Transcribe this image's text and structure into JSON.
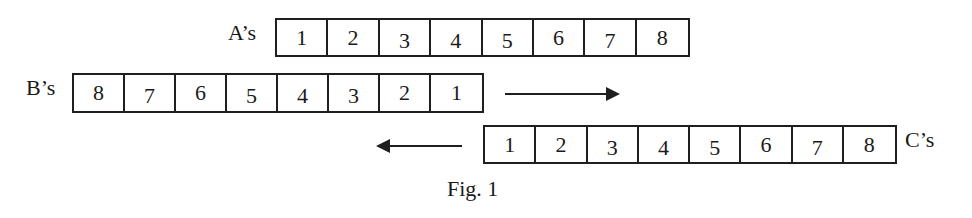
{
  "figure": {
    "caption": "Fig. 1",
    "rows": [
      {
        "id": "a",
        "label": "A’s",
        "cells": [
          "1",
          "2",
          "3",
          "4",
          "5",
          "6",
          "7",
          "8"
        ]
      },
      {
        "id": "b",
        "label": "B’s",
        "cells": [
          "8",
          "7",
          "6",
          "5",
          "4",
          "3",
          "2",
          "1"
        ]
      },
      {
        "id": "c",
        "label": "C’s",
        "cells": [
          "1",
          "2",
          "3",
          "4",
          "5",
          "6",
          "7",
          "8"
        ]
      }
    ],
    "arrows": [
      {
        "id": "b-direction",
        "direction": "right"
      },
      {
        "id": "c-direction",
        "direction": "left"
      }
    ]
  },
  "colors": {
    "line": "#1f1f1f",
    "text": "#1a1a1a",
    "background": "#ffffff"
  }
}
